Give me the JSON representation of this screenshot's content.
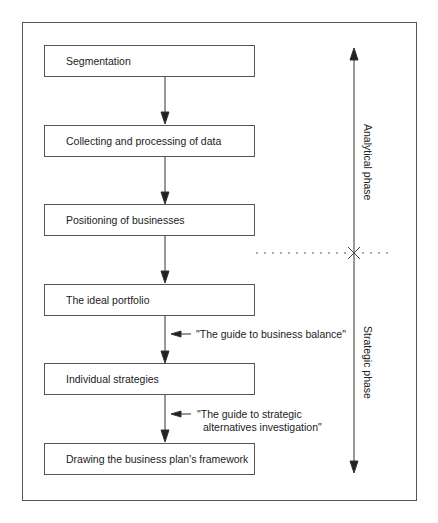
{
  "diagram": {
    "steps": [
      {
        "label": "Segmentation"
      },
      {
        "label": "Collecting and processing of data"
      },
      {
        "label": "Positioning of businesses"
      },
      {
        "label": "The ideal portfolio"
      },
      {
        "label": "Individual strategies"
      },
      {
        "label": "Drawing the business plan's framework"
      }
    ],
    "annotations": [
      {
        "text_line1": "\"The guide to business balance\"",
        "text_line2": ""
      },
      {
        "text_line1": "\"The guide to strategic",
        "text_line2": "alternatives investigation\""
      }
    ],
    "phases": [
      {
        "label": "Analytical phase"
      },
      {
        "label": "Strategic phase"
      }
    ],
    "colors": {
      "line": "#333333",
      "border": "#555555",
      "background": "#ffffff"
    }
  }
}
